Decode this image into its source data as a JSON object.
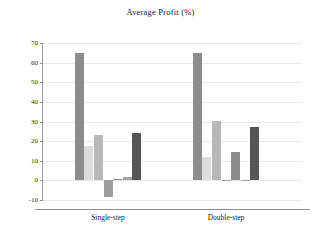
{
  "chart_data": {
    "type": "bar",
    "title": "Average Profit (%)",
    "xlabel": "",
    "ylabel": "",
    "categories": [
      "Single-step",
      "Double-step"
    ],
    "ylim": [
      -10,
      70
    ],
    "yticks": [
      -10,
      0,
      10,
      20,
      30,
      40,
      50,
      60,
      70
    ],
    "ytick_labels": [
      "-10",
      "0",
      "10",
      "20",
      "30",
      "40",
      "50",
      "60",
      "70"
    ],
    "grid": true,
    "legend": "none",
    "series": [
      {
        "name": "series-1",
        "color": "#8c8c8c",
        "values": [
          65.0,
          65.0
        ]
      },
      {
        "name": "series-2",
        "color": "#dcdcdc",
        "values": [
          17.5,
          12.0
        ]
      },
      {
        "name": "series-3",
        "color": "#b8b8b8",
        "values": [
          23.0,
          30.5
        ]
      },
      {
        "name": "series-4",
        "color": "#9e9e9e",
        "values": [
          -8.5,
          0.3
        ]
      },
      {
        "name": "series-5",
        "color": "#8c8c8c",
        "values": [
          0.5,
          14.3
        ]
      },
      {
        "name": "series-6",
        "color": "#a5a5a5",
        "values": [
          1.5,
          0.3
        ]
      },
      {
        "name": "series-7",
        "color": "#565656",
        "values": [
          24.0,
          27.0
        ]
      }
    ]
  },
  "axes": {
    "y_tick_labels": [
      "70",
      "60",
      "50",
      "40",
      "30",
      "20",
      "10",
      "0",
      "-10"
    ],
    "x_tick_labels": [
      "Single-step",
      "Double-step"
    ]
  },
  "colors": {
    "grid": "#e8e8e8",
    "axis": "#8d8d8d",
    "text": "#1c1c1c",
    "background": "#ffffff"
  }
}
